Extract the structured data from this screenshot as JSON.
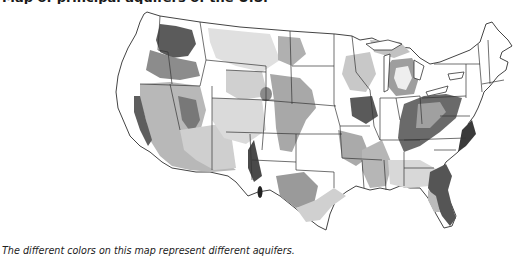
{
  "heading": {
    "text": "Map of principal aquifers of the U.S."
  },
  "map": {
    "subject": "Principal aquifers of the contiguous United States",
    "style": "grayscale",
    "palette": {
      "land": "#ffffff",
      "light_aquifer": "#d6d6d6",
      "medium_aquifer": "#a9a9a9",
      "dark_aquifer": "#6e6e6e",
      "darkest_aquifer": "#3a3a3a",
      "state_border": "#333333"
    },
    "regions": [
      {
        "name": "Columbia Plateau basaltic-rock aquifers",
        "tone": "darkest_aquifer"
      },
      {
        "name": "Basin and Range basin-fill aquifers",
        "tone": "medium_aquifer"
      },
      {
        "name": "Central Valley aquifer system",
        "tone": "dark_aquifer"
      },
      {
        "name": "High Plains aquifer",
        "tone": "medium_aquifer"
      },
      {
        "name": "Colorado Plateaus aquifers",
        "tone": "light_aquifer"
      },
      {
        "name": "Cambrian-Ordovician aquifer system",
        "tone": "light_aquifer"
      },
      {
        "name": "Michigan basin aquifers",
        "tone": "medium_aquifer"
      },
      {
        "name": "Valley and Ridge aquifers",
        "tone": "dark_aquifer"
      },
      {
        "name": "Mississippi embayment aquifer system",
        "tone": "medium_aquifer"
      },
      {
        "name": "Coastal lowlands aquifer system",
        "tone": "light_aquifer"
      },
      {
        "name": "Floridan aquifer system",
        "tone": "dark_aquifer"
      },
      {
        "name": "Edwards-Trinity aquifer system",
        "tone": "medium_aquifer"
      }
    ]
  },
  "caption": {
    "text": "The different colors on this map represent different aquifers."
  }
}
